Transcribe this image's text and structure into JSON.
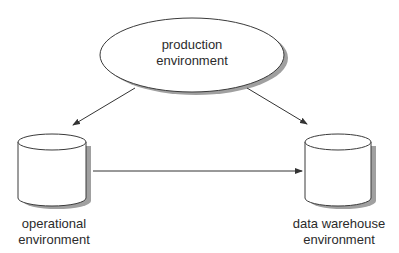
{
  "diagram": {
    "nodes": {
      "production": {
        "label_line1": "production",
        "label_line2": "environment",
        "shape": "ellipse"
      },
      "operational": {
        "label_line1": "operational",
        "label_line2": "environment",
        "shape": "cylinder"
      },
      "warehouse": {
        "label_line1": "data warehouse",
        "label_line2": "environment",
        "shape": "cylinder"
      }
    },
    "edges": [
      {
        "from": "production",
        "to": "operational"
      },
      {
        "from": "production",
        "to": "warehouse"
      },
      {
        "from": "operational",
        "to": "warehouse"
      }
    ],
    "colors": {
      "stroke": "#3a3a3a",
      "shadow": "#9a9a9a",
      "fill": "#ffffff"
    }
  }
}
